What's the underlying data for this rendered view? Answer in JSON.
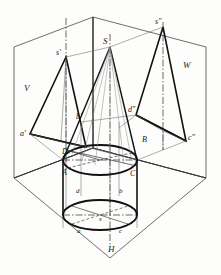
{
  "figure": {
    "type": "descriptive-geometry-projection"
  },
  "planes": {
    "v_label": "V",
    "w_label": "W",
    "h_label": "H"
  },
  "labels": {
    "apex_front": "s'",
    "apex_space": "S",
    "apex_side": "s″",
    "a_front": "a'",
    "b_front": "b'",
    "d_side": "d″",
    "c_side": "c″",
    "A_space": "A",
    "B_space": "B",
    "C_space": "C",
    "D_space": "D",
    "a_top": "a",
    "b_top": "b",
    "c_top": "c",
    "d_top": "d",
    "s_top": "s"
  },
  "colors": {
    "line": "#1a1a1a",
    "thin": "#555555",
    "background": "#fdfdfc"
  }
}
